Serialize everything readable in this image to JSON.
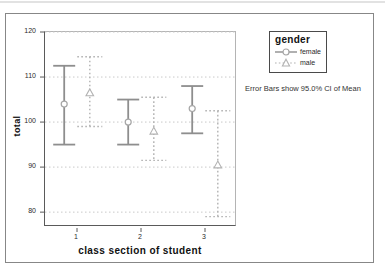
{
  "chart_data": {
    "type": "errorbar",
    "title": "",
    "xlabel": "class section of student",
    "ylabel": "total",
    "x_categories": [
      "1",
      "2",
      "3"
    ],
    "y_ticks": [
      80,
      90,
      100,
      110,
      120
    ],
    "ylim": [
      76.7,
      120
    ],
    "grid": "horizontal dotted",
    "annotation": "Error Bars show 95.0% CI of Mean",
    "legend": {
      "title": "gender",
      "position": "top-right-outside"
    },
    "series": [
      {
        "name": "female",
        "marker": "circle",
        "line_style": "solid",
        "bar_color": "#8e8e8e",
        "marker_color": "#a6a6a6",
        "points": [
          {
            "category": "1",
            "mean": 104,
            "ci_low": 95,
            "ci_high": 112.5
          },
          {
            "category": "2",
            "mean": 100,
            "ci_low": 95,
            "ci_high": 105
          },
          {
            "category": "3",
            "mean": 103,
            "ci_low": 97.5,
            "ci_high": 108
          }
        ]
      },
      {
        "name": "male",
        "marker": "triangle",
        "line_style": "dotted",
        "bar_color": "#b2b2b2",
        "marker_color": "#b2b2b2",
        "points": [
          {
            "category": "1",
            "mean": 106.5,
            "ci_low": 99,
            "ci_high": 114.5
          },
          {
            "category": "2",
            "mean": 98,
            "ci_low": 91.5,
            "ci_high": 105.5
          },
          {
            "category": "3",
            "mean": 90.5,
            "ci_low": 79,
            "ci_high": 102.5
          }
        ]
      }
    ],
    "colors": {
      "grid": "#c9c9c9",
      "axis": "#5a5a5a",
      "frame": "#b4b4b4",
      "text": "#1a1a1a"
    }
  }
}
